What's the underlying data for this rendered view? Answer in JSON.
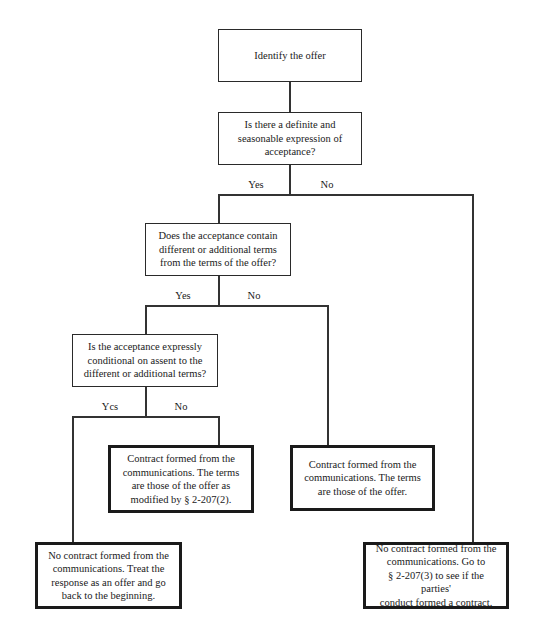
{
  "diagram": {
    "type": "flowchart",
    "nodes": [
      {
        "id": "n1",
        "text": "Identify the offer",
        "kind": "start"
      },
      {
        "id": "n2",
        "text": "Is there a definite and\nseasonable expression of\nacceptance?",
        "kind": "decision"
      },
      {
        "id": "n3",
        "text": "Does the acceptance contain\ndifferent or additional terms\nfrom the terms of the offer?",
        "kind": "decision"
      },
      {
        "id": "n4",
        "text": "Is the acceptance expressly\nconditional on assent to the\ndifferent or additional terms?",
        "kind": "decision"
      },
      {
        "id": "n5",
        "text": "Contract formed from the\ncommunications.  The terms\nare those of the offer as\nmodified by § 2-207(2).",
        "kind": "outcome"
      },
      {
        "id": "n6",
        "text": "Contract formed from the\ncommunications.  The terms\nare those of the offer.",
        "kind": "outcome"
      },
      {
        "id": "n7",
        "text": "No contract formed from the\ncommunications.  Treat the\nresponse as an offer and go\nback to the beginning.",
        "kind": "outcome"
      },
      {
        "id": "n8",
        "text": "No contract formed from the\ncommunications.  Go to\n§ 2-207(3) to see if the parties'\nconduct formed a contract.",
        "kind": "outcome"
      }
    ],
    "edges": [
      {
        "from": "n1",
        "to": "n2",
        "label": ""
      },
      {
        "from": "n2",
        "to": "n3",
        "label": "Yes"
      },
      {
        "from": "n2",
        "to": "n8",
        "label": "No"
      },
      {
        "from": "n3",
        "to": "n4",
        "label": "Yes"
      },
      {
        "from": "n3",
        "to": "n6",
        "label": "No"
      },
      {
        "from": "n4",
        "to": "n7",
        "label": "Ycs"
      },
      {
        "from": "n4",
        "to": "n5",
        "label": "No"
      }
    ],
    "branch_labels": {
      "q1_yes": "Yes",
      "q1_no": "No",
      "q2_yes": "Yes",
      "q2_no": "No",
      "q3_yes": "Ycs",
      "q3_no": "No"
    }
  }
}
